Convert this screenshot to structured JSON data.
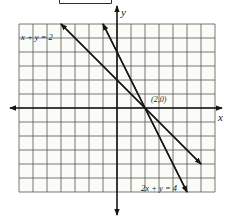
{
  "chart_data": {
    "type": "line",
    "title": "",
    "xlabel": "x",
    "ylabel": "y",
    "xlim": [
      -7,
      7
    ],
    "ylim": [
      -6,
      6
    ],
    "grid": true,
    "grid_step": 1,
    "legend_position": "none",
    "series": [
      {
        "name": "x + y = 2",
        "slope": -1,
        "y_intercept": 2,
        "x_intercept": 2,
        "points": [
          [
            -4,
            6
          ],
          [
            0,
            2
          ],
          [
            2,
            0
          ],
          [
            6,
            -4
          ]
        ]
      },
      {
        "name": "2x + y = 4",
        "slope": -2,
        "y_intercept": 4,
        "x_intercept": 2,
        "points": [
          [
            -1,
            6
          ],
          [
            0,
            4
          ],
          [
            2,
            0
          ],
          [
            5,
            -6
          ]
        ]
      }
    ],
    "intersection": {
      "x": 2,
      "y": 0
    },
    "annotations": [
      {
        "text": "(2,0)",
        "x": 2,
        "y": 0
      }
    ]
  },
  "colors": {
    "ink": "#161614",
    "grid": "#555550",
    "paper": "#fbfbf8"
  }
}
